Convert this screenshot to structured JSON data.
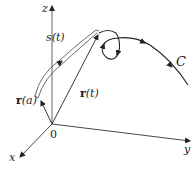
{
  "figure": {
    "axes": {
      "z_label": "z",
      "x_label": "x",
      "y_label": "y",
      "origin_label": "0"
    },
    "vectors": {
      "ra_bold": "r",
      "ra_arg": "(a)",
      "rt_bold": "r",
      "rt_arg": "(t)"
    },
    "arc_length_label": "s(t)",
    "curve_label": "C",
    "colors": {
      "stroke": "#222222",
      "arc_band": "#444444",
      "background": "#ffffff"
    }
  }
}
